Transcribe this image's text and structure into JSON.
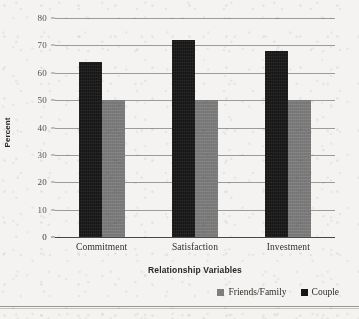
{
  "chart_data": {
    "type": "bar",
    "title": "",
    "subtitle": "",
    "xlabel": "Relationship Variables",
    "ylabel": "Percent",
    "categories": [
      "Commitment",
      "Satisfaction",
      "Investment"
    ],
    "series": [
      {
        "name": "Friends/Family",
        "values": [
          50,
          50,
          50
        ],
        "color": "#7e7e7e"
      },
      {
        "name": "Couple",
        "values": [
          64,
          72,
          68
        ],
        "color": "#161616"
      }
    ],
    "series_draw_order": [
      "Couple",
      "Friends/Family"
    ],
    "ylim": [
      0,
      80
    ],
    "yticks": [
      0,
      10,
      20,
      30,
      40,
      50,
      60,
      70,
      80
    ],
    "ytick_labels": [
      "0",
      "10",
      "20",
      "30",
      "40",
      "50",
      "60",
      "70",
      "80"
    ],
    "grid": "horizontal",
    "legend_position": "bottom-right"
  },
  "axes": {
    "y_title": "Percent",
    "x_title": "Relationship Variables",
    "y_ticks": [
      {
        "value": 80,
        "label": "80"
      },
      {
        "value": 70,
        "label": "70"
      },
      {
        "value": 60,
        "label": "60"
      },
      {
        "value": 50,
        "label": "50"
      },
      {
        "value": 40,
        "label": "40"
      },
      {
        "value": 30,
        "label": "30"
      },
      {
        "value": 20,
        "label": "20"
      },
      {
        "value": 10,
        "label": "10"
      },
      {
        "value": 0,
        "label": "0"
      }
    ]
  },
  "groups": [
    {
      "category": "Commitment",
      "couple": 64,
      "friends": 50
    },
    {
      "category": "Satisfaction",
      "couple": 72,
      "friends": 50
    },
    {
      "category": "Investment",
      "couple": 68,
      "friends": 50
    }
  ],
  "legend": {
    "items": [
      {
        "label": "Friends/Family",
        "color": "#7e7e7e"
      },
      {
        "label": "Couple",
        "color": "#161616"
      }
    ]
  }
}
